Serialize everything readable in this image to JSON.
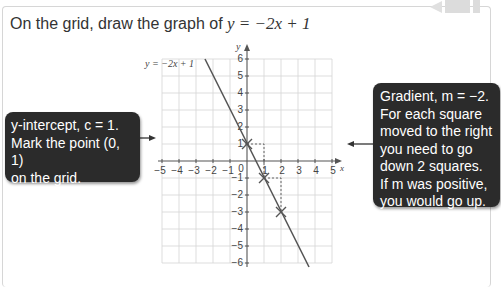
{
  "question": {
    "prefix": "On the grid, draw the graph of ",
    "equation": "y = −2x + 1"
  },
  "graph": {
    "line_label": "y = −2x + 1",
    "x_axis_label": "x",
    "y_axis_label": "y",
    "x_ticks": [
      "−5",
      "−4",
      "−3",
      "−2",
      "−1",
      "0",
      "1",
      "2",
      "3",
      "4",
      "5"
    ],
    "y_ticks": [
      "6",
      "5",
      "4",
      "3",
      "2",
      "1",
      "−1",
      "−2",
      "−3",
      "−4",
      "−5",
      "−6"
    ],
    "marked_points": [
      [
        0,
        1
      ],
      [
        1,
        -1
      ],
      [
        2,
        -3
      ]
    ],
    "line_color": "#555555",
    "grid_color": "#d4d4d4"
  },
  "callouts": {
    "left": {
      "line1": "y-intercept, c = 1.",
      "line2": "Mark the point (0, 1)",
      "line3": "on the grid."
    },
    "right": {
      "line1": "Gradient, m = −2.",
      "line2": "For each square",
      "line3": "moved to the right",
      "line4": "you need to go",
      "line5": "down 2 squares.",
      "line6": "If m was positive,",
      "line7": "you would go up."
    }
  }
}
